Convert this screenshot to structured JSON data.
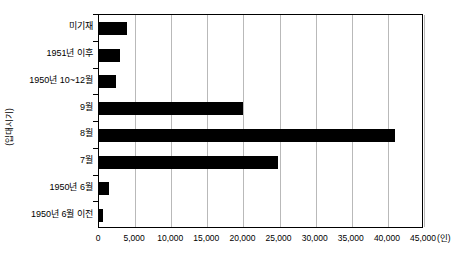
{
  "chart_data": {
    "type": "bar",
    "orientation": "horizontal",
    "title": "",
    "xlabel": "",
    "ylabel": "(입대시기)",
    "x_unit": "(인)",
    "categories": [
      "미기재",
      "1951년 이후",
      "1950년 10~12월",
      "9월",
      "8월",
      "7월",
      "1950년 6월",
      "1950년 6월 이전"
    ],
    "values": [
      3900,
      2900,
      2300,
      20000,
      41000,
      24800,
      1400,
      500
    ],
    "xlim": [
      0,
      45000
    ],
    "xticks": [
      0,
      5000,
      10000,
      15000,
      20000,
      25000,
      30000,
      35000,
      40000,
      45000
    ],
    "xtick_labels": [
      "0",
      "5,000",
      "10,000",
      "15,000",
      "20,000",
      "25,000",
      "30,000",
      "35,000",
      "40,000",
      "45,000"
    ],
    "grid": true,
    "grid_axis": "x",
    "legend": false,
    "bar_color": "#000000",
    "grid_color": "#b9b9b9",
    "axis_color": "#000000"
  }
}
